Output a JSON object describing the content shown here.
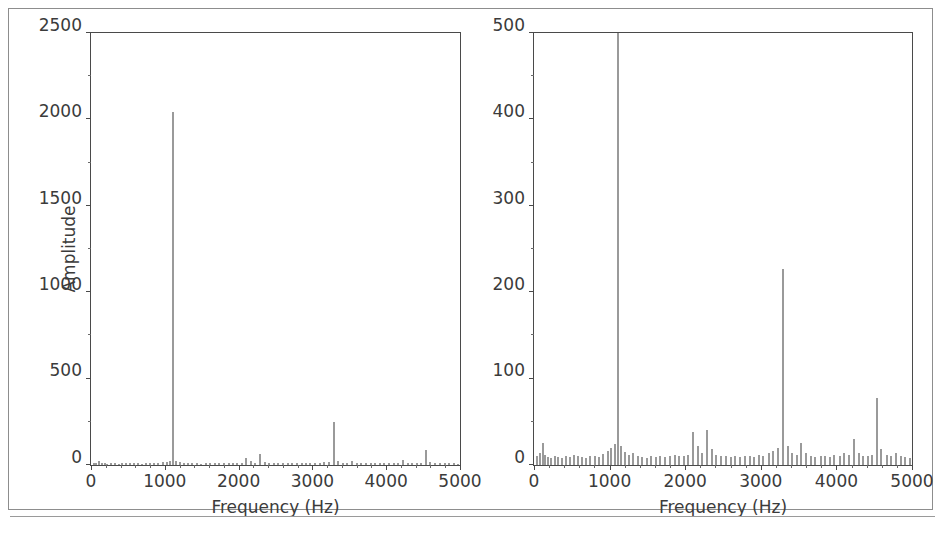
{
  "figure": {
    "background_color": "#ffffff",
    "frame_color": "#8d8d8d",
    "axis_color": "#4a4a4a",
    "bar_color": "#9a9a9a",
    "text_color": "#3b3b3b"
  },
  "chart_data": [
    {
      "panel": "left",
      "type": "bar",
      "title": "",
      "xlabel": "Frequency (Hz)",
      "ylabel": "Amplitude",
      "xlim": [
        0,
        5000
      ],
      "ylim": [
        0,
        2500
      ],
      "xticks": [
        0,
        1000,
        2000,
        3000,
        4000,
        5000
      ],
      "xtick_labels": [
        "0",
        "1000",
        "2000",
        "3000",
        "4000",
        "5000"
      ],
      "yticks": [
        0,
        500,
        1000,
        1500,
        2000,
        2500
      ],
      "ytick_labels": [
        "0",
        "500",
        "1000",
        "1500",
        "2000",
        "2500"
      ],
      "grid": false,
      "legend": null,
      "x": [
        30,
        60,
        100,
        130,
        170,
        210,
        260,
        310,
        360,
        410,
        460,
        520,
        570,
        620,
        680,
        730,
        790,
        840,
        900,
        960,
        1010,
        1060,
        1100,
        1140,
        1190,
        1240,
        1300,
        1360,
        1420,
        1480,
        1540,
        1600,
        1660,
        1720,
        1790,
        1850,
        1910,
        1970,
        2030,
        2090,
        2150,
        2210,
        2280,
        2340,
        2400,
        2460,
        2520,
        2590,
        2650,
        2710,
        2780,
        2840,
        2900,
        2960,
        3020,
        3090,
        3150,
        3210,
        3280,
        3340,
        3400,
        3460,
        3520,
        3590,
        3650,
        3710,
        3780,
        3840,
        3900,
        3960,
        4030,
        4090,
        4150,
        4220,
        4280,
        4340,
        4400,
        4460,
        4520,
        4580,
        4650,
        4710,
        4780,
        4840,
        4900,
        4960
      ],
      "values": [
        10,
        14,
        26,
        12,
        9,
        8,
        10,
        9,
        8,
        10,
        9,
        12,
        10,
        9,
        8,
        11,
        10,
        9,
        13,
        16,
        20,
        24,
        2045,
        22,
        15,
        12,
        14,
        10,
        9,
        8,
        10,
        9,
        11,
        9,
        10,
        12,
        11,
        10,
        12,
        38,
        22,
        14,
        62,
        18,
        12,
        10,
        11,
        9,
        10,
        9,
        11,
        10,
        9,
        12,
        10,
        14,
        16,
        20,
        248,
        22,
        14,
        12,
        26,
        14,
        10,
        9,
        11,
        10,
        9,
        12,
        10,
        14,
        12,
        30,
        14,
        11,
        10,
        12,
        86,
        18,
        12,
        10,
        14,
        11,
        9,
        8
      ],
      "peaks": [
        {
          "frequency": 1100,
          "amplitude": 2045
        },
        {
          "frequency": 3280,
          "amplitude": 248
        },
        {
          "frequency": 4520,
          "amplitude": 86
        },
        {
          "frequency": 2280,
          "amplitude": 62
        },
        {
          "frequency": 2090,
          "amplitude": 38
        },
        {
          "frequency": 100,
          "amplitude": 26
        }
      ]
    },
    {
      "panel": "right",
      "type": "bar",
      "title": "",
      "xlabel": "Frequency (Hz)",
      "ylabel": "",
      "xlim": [
        0,
        5000
      ],
      "ylim": [
        0,
        500
      ],
      "xticks": [
        0,
        1000,
        2000,
        3000,
        4000,
        5000
      ],
      "xtick_labels": [
        "0",
        "1000",
        "2000",
        "3000",
        "4000",
        "5000"
      ],
      "yticks": [
        0,
        100,
        200,
        300,
        400,
        500
      ],
      "ytick_labels": [
        "0",
        "100",
        "200",
        "300",
        "400",
        "500"
      ],
      "grid": false,
      "legend": null,
      "note": "Same spectrum as left panel, y-axis zoomed to 0-500; the 1100 Hz peak is clipped at the top of the axes.",
      "x": [
        30,
        60,
        100,
        130,
        170,
        210,
        260,
        310,
        360,
        410,
        460,
        520,
        570,
        620,
        680,
        730,
        790,
        840,
        900,
        960,
        1010,
        1060,
        1100,
        1140,
        1190,
        1240,
        1300,
        1360,
        1420,
        1480,
        1540,
        1600,
        1660,
        1720,
        1790,
        1850,
        1910,
        1970,
        2030,
        2090,
        2150,
        2210,
        2280,
        2340,
        2400,
        2460,
        2520,
        2590,
        2650,
        2710,
        2780,
        2840,
        2900,
        2960,
        3020,
        3090,
        3150,
        3210,
        3280,
        3340,
        3400,
        3460,
        3520,
        3590,
        3650,
        3710,
        3780,
        3840,
        3900,
        3960,
        4030,
        4090,
        4150,
        4220,
        4280,
        4340,
        4400,
        4460,
        4520,
        4580,
        4650,
        4710,
        4780,
        4840,
        4900,
        4960
      ],
      "values": [
        10,
        14,
        26,
        12,
        9,
        8,
        10,
        9,
        8,
        10,
        9,
        12,
        10,
        9,
        8,
        11,
        10,
        9,
        13,
        16,
        20,
        24,
        500,
        22,
        15,
        12,
        14,
        10,
        9,
        8,
        10,
        9,
        11,
        9,
        10,
        12,
        11,
        10,
        12,
        38,
        22,
        14,
        41,
        18,
        12,
        10,
        11,
        9,
        10,
        9,
        11,
        10,
        9,
        12,
        10,
        14,
        16,
        20,
        227,
        22,
        14,
        12,
        26,
        14,
        10,
        9,
        11,
        10,
        9,
        12,
        10,
        14,
        12,
        30,
        14,
        11,
        10,
        12,
        78,
        18,
        12,
        10,
        14,
        11,
        9,
        8
      ],
      "peaks": [
        {
          "frequency": 1100,
          "amplitude": 500
        },
        {
          "frequency": 3280,
          "amplitude": 227
        },
        {
          "frequency": 4520,
          "amplitude": 78
        },
        {
          "frequency": 2280,
          "amplitude": 41
        },
        {
          "frequency": 2090,
          "amplitude": 38
        },
        {
          "frequency": 100,
          "amplitude": 26
        }
      ]
    }
  ]
}
